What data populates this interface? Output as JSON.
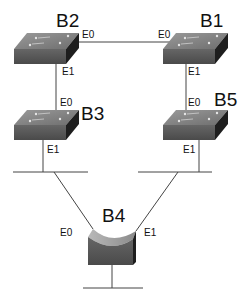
{
  "diagram": {
    "type": "network-topology",
    "nodes": [
      {
        "id": "B2",
        "label": "B2",
        "kind": "switch",
        "ports": {
          "E0": "E0",
          "E1": "E1"
        }
      },
      {
        "id": "B1",
        "label": "B1",
        "kind": "switch",
        "ports": {
          "E0": "E0",
          "E1": "E1"
        }
      },
      {
        "id": "B3",
        "label": "B3",
        "kind": "switch",
        "ports": {
          "E0": "E0",
          "E1": "E1"
        }
      },
      {
        "id": "B5",
        "label": "B5",
        "kind": "switch",
        "ports": {
          "E0": "E0",
          "E1": "E1"
        }
      },
      {
        "id": "B4",
        "label": "B4",
        "kind": "bridge",
        "ports": {
          "E0": "E0",
          "E1": "E1"
        }
      }
    ],
    "links": [
      {
        "from": "B2.E0",
        "to": "B1.E0"
      },
      {
        "from": "B2.E1",
        "to": "B3.E0"
      },
      {
        "from": "B1.E1",
        "to": "B5.E0"
      },
      {
        "from": "B3.E1",
        "to": "LAN-left"
      },
      {
        "from": "B5.E1",
        "to": "LAN-right"
      },
      {
        "from": "LAN-left",
        "to": "B4.E0"
      },
      {
        "from": "LAN-right",
        "to": "B4.E1"
      },
      {
        "from": "B4",
        "to": "LAN-bottom"
      }
    ],
    "colors": {
      "switch_top": "#8a8a8a",
      "switch_front": "#5a5a5a",
      "switch_side": "#1e1e1e",
      "line": "#444444"
    }
  }
}
